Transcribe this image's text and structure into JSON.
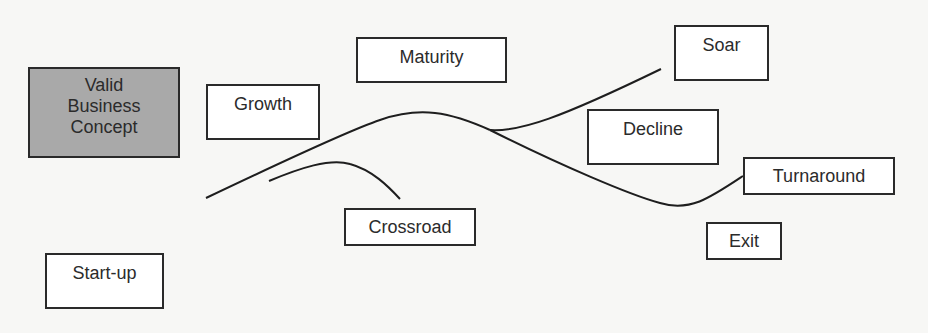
{
  "diagram": {
    "type": "business life cycle flow",
    "colors": {
      "background": "#f7f7f5",
      "box_border": "#2a2a2a",
      "box_fill": "#ffffff",
      "highlight_fill": "#a9a9a9",
      "line": "#1e1e1e",
      "text": "#2b2b2b"
    },
    "nodes": [
      {
        "id": "valid-business-concept",
        "lines": [
          "Valid",
          "Business",
          "Concept"
        ],
        "shaded": true
      },
      {
        "id": "growth",
        "label": "Growth"
      },
      {
        "id": "maturity",
        "label": "Maturity"
      },
      {
        "id": "soar",
        "label": "Soar"
      },
      {
        "id": "decline",
        "label": "Decline"
      },
      {
        "id": "turnaround",
        "label": "Turnaround"
      },
      {
        "id": "crossroad",
        "label": "Crossroad"
      },
      {
        "id": "exit",
        "label": "Exit"
      },
      {
        "id": "start-up",
        "label": "Start-up"
      }
    ],
    "curves": [
      {
        "id": "main-lifecycle-curve",
        "description": "Rises from start through growth, peaks at maturity, splits"
      },
      {
        "id": "soar-branch",
        "description": "Upper branch rising toward Soar"
      },
      {
        "id": "decline-turnaround-branch",
        "description": "Lower branch descending past Decline, dipping, rising to Turnaround"
      },
      {
        "id": "crossroad-curve",
        "description": "Short arc rising then falling toward Crossroad"
      }
    ]
  }
}
